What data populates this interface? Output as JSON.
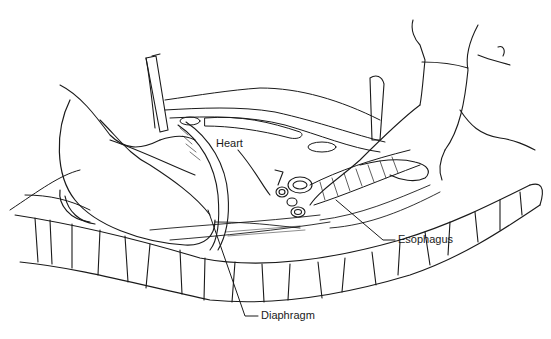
{
  "figure": {
    "labels": {
      "heart": "Heart",
      "esophagus": "Esophagus",
      "diaphragm": "Diaphragm"
    }
  }
}
